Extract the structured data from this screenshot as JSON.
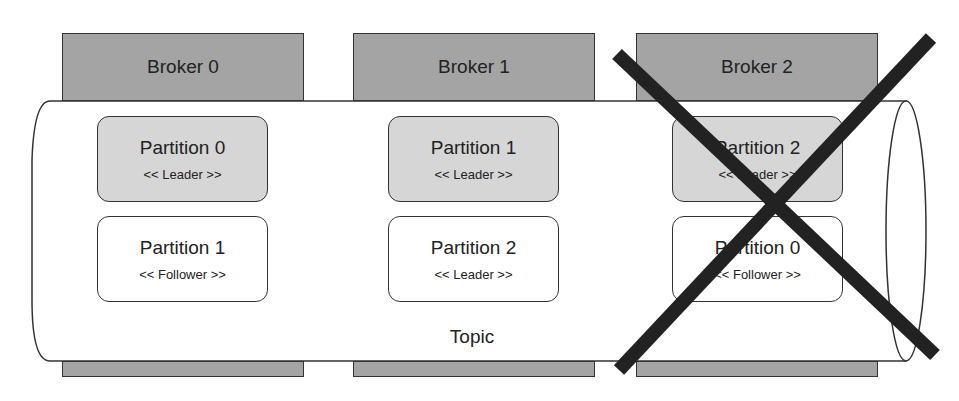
{
  "diagram": {
    "topic_label": "Topic",
    "colors": {
      "broker_fill": "#a4a4a4",
      "leader_fill": "#d6d6d6",
      "follower_fill": "#ffffff",
      "outline": "#333333",
      "cross": "#222222"
    },
    "brokers": [
      {
        "label": "Broker 0",
        "failed": false,
        "partitions": [
          {
            "name": "Partition 0",
            "role": "<< Leader >>"
          },
          {
            "name": "Partition 1",
            "role": "<< Follower >>"
          }
        ]
      },
      {
        "label": "Broker 1",
        "failed": false,
        "partitions": [
          {
            "name": "Partition 1",
            "role": "<< Leader >>"
          },
          {
            "name": "Partition 2",
            "role": "<< Leader >>"
          }
        ]
      },
      {
        "label": "Broker 2",
        "failed": true,
        "partitions": [
          {
            "name": "Partition 2",
            "role": "<< Leader >>"
          },
          {
            "name": "Partition 0",
            "role": "<< Follower >>"
          }
        ]
      }
    ],
    "failure_marker": "X"
  }
}
